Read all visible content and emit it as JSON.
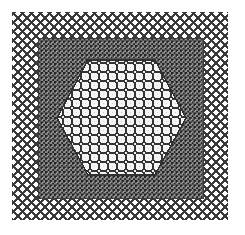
{
  "figure": {
    "title": "Nested mesh refinement diagram",
    "width": 245,
    "height": 235,
    "background_color": "#ffffff"
  },
  "chart_data": {
    "type": "diagram",
    "title": "Nested mesh refinement diagram",
    "xlabel": "",
    "ylabel": "",
    "grid": true,
    "legend": "none",
    "regions": [
      {
        "name": "outer-coarse-mesh",
        "label": "Outer coarse diagonal mesh",
        "shape": "rectangle",
        "x": 12,
        "y": 12,
        "width": 216,
        "height": 208,
        "fill_color": "#ffffff",
        "line_color": "#3a3a3a",
        "pattern": "diagonal-diamond-crosshatch",
        "cell_pitch": 9.0,
        "line_width": 1.6,
        "cell_count_x": 24,
        "cell_count_y": 23
      },
      {
        "name": "middle-dense-mesh",
        "label": "Middle dense checkered mesh",
        "shape": "rectangle",
        "x": 38,
        "y": 38,
        "width": 165,
        "height": 160,
        "fill_color": "#6e6e6e",
        "line_color": "#272727",
        "pattern": "fine-checker-dot-grid",
        "cell_pitch": 4.5,
        "line_width": 1.1,
        "cell_count_x": 37,
        "cell_count_y": 36
      },
      {
        "name": "inner-hexagon-mesh",
        "label": "Inner hexagonal rounded-cell mesh",
        "shape": "hexagon",
        "fill_color": "#f2f2f2",
        "line_color": "#303030",
        "pattern": "rounded-square-grid",
        "cell_pitch": 9.0,
        "line_width": 1.5,
        "cell_count_x": 15,
        "cell_count_y": 13,
        "vertices": [
          [
            57,
            118
          ],
          [
            88,
            60
          ],
          [
            155,
            60
          ],
          [
            186,
            118
          ],
          [
            155,
            175
          ],
          [
            88,
            175
          ]
        ],
        "flat_top_y": 60,
        "flat_bottom_y": 175,
        "left_vertex_x": 57,
        "right_vertex_x": 186,
        "center": [
          121.5,
          117.5
        ]
      }
    ],
    "colors": {
      "background": "#ffffff",
      "outer_line": "#3a3a3a",
      "middle_fill": "#6e6e6e",
      "middle_line": "#272727",
      "inner_fill": "#f2f2f2",
      "inner_line": "#303030"
    }
  }
}
